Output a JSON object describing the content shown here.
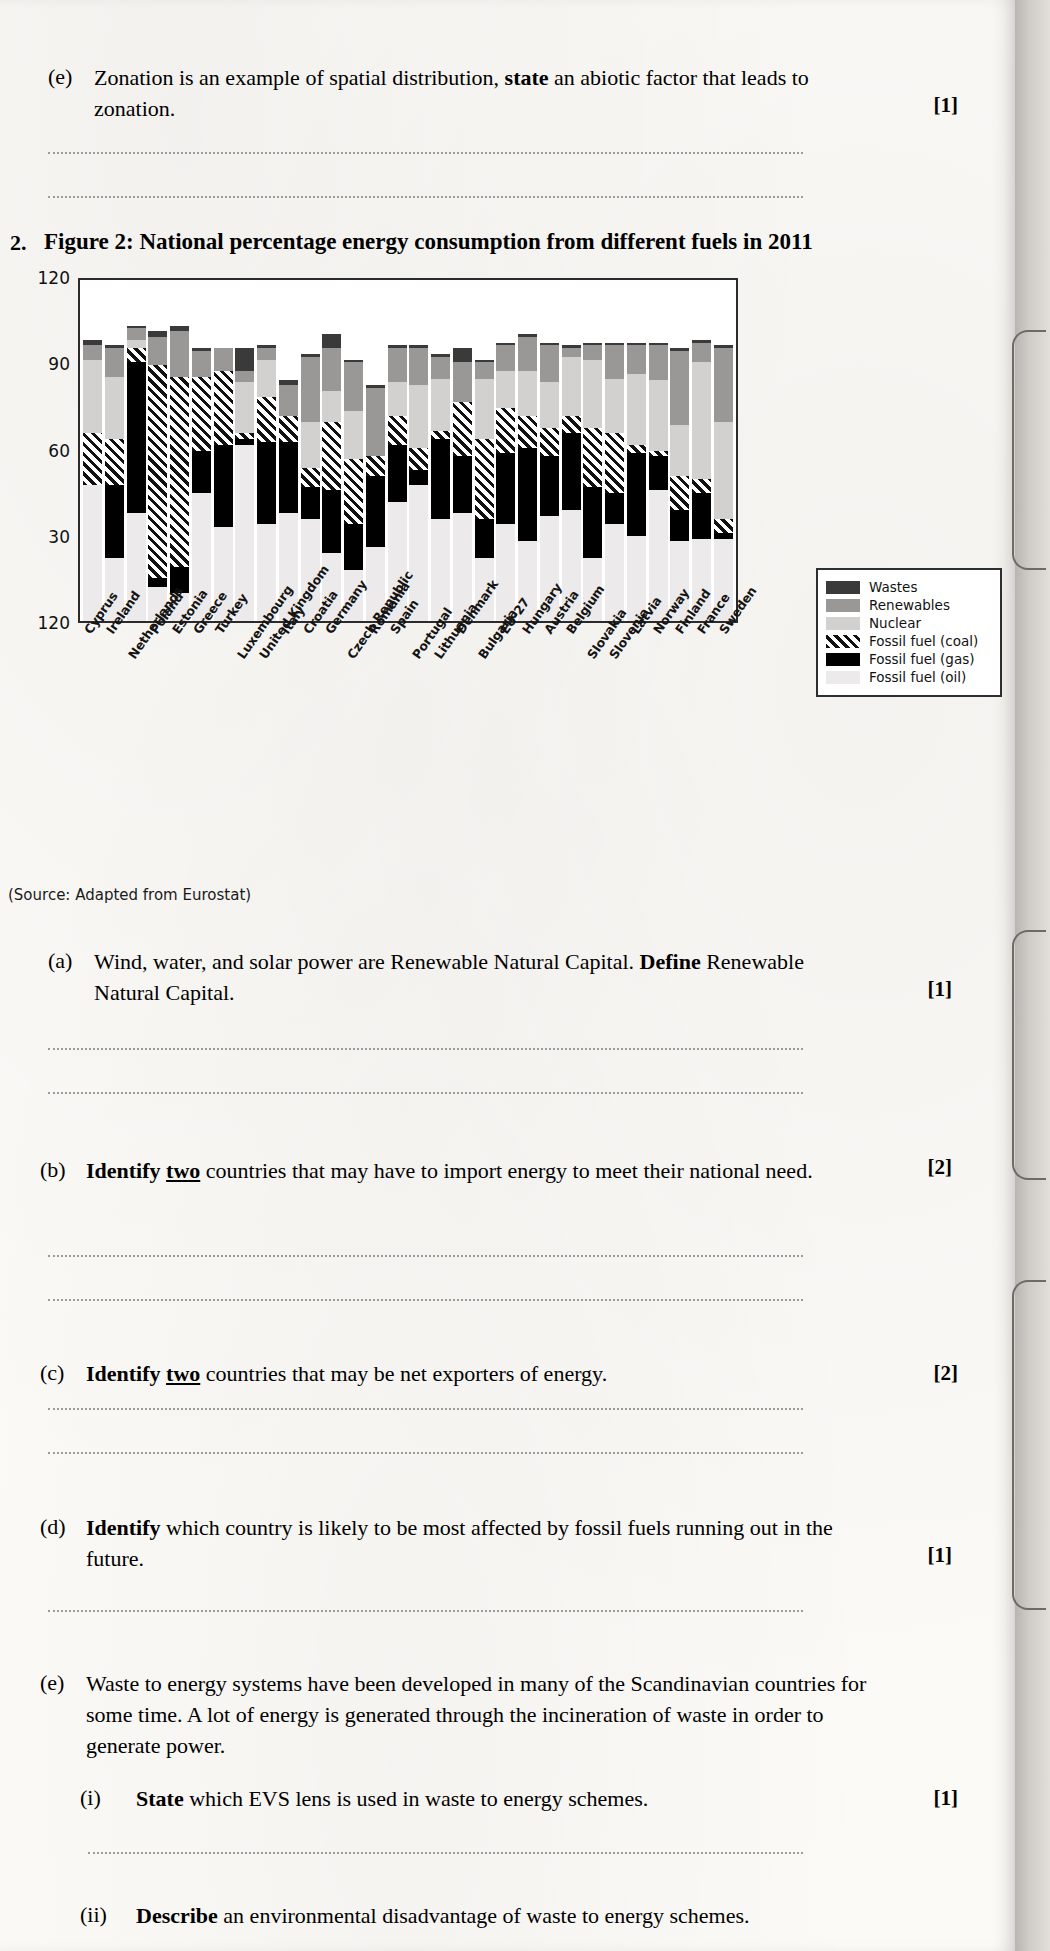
{
  "page": {
    "source_note": "(Source: Adapted from Eurostat)"
  },
  "q1e": {
    "label": "(e)",
    "text_before": "Zonation is an example of spatial distribution, ",
    "bold": "state",
    "text_after": " an abiotic factor that leads to zonation.",
    "marks": "[1]"
  },
  "question2": {
    "number": "2.",
    "figure_title": "Figure 2: National percentage energy consumption from different fuels in 2011",
    "parts": [
      {
        "label": "(a)",
        "text_before": "Wind, water, and solar power are Renewable Natural Capital. ",
        "bold": "Define",
        "text_after": " Renewable Natural Capital.",
        "marks": "[1]",
        "lines": 2
      },
      {
        "label": "(b)",
        "bold": "Identify",
        "underlined": "two",
        "text_after": " countries that may have to import energy to meet their national need.",
        "marks": "[2]",
        "lines": 2
      },
      {
        "label": "(c)",
        "bold": "Identify",
        "underlined": "two",
        "text_after": " countries that may be net exporters of energy.",
        "marks": "[2]",
        "lines": 2
      },
      {
        "label": "(d)",
        "bold": "Identify",
        "text_after": " which country is likely to be most affected by fossil fuels running out in the future.",
        "marks": "[1]",
        "lines": 1
      },
      {
        "label": "(e)",
        "text": "Waste to energy systems have been developed in many of the Scandinavian countries for some time. A lot of energy is generated through the incineration of waste in order to generate power.",
        "subparts": [
          {
            "label": "(i)",
            "bold": "State",
            "text_after": " which EVS lens is used in waste to energy schemes.",
            "marks": "[1]",
            "lines": 1
          },
          {
            "label": "(ii)",
            "bold": "Describe",
            "text_after": " an environmental disadvantage of waste to energy schemes.",
            "marks": "",
            "lines": 0
          }
        ]
      }
    ]
  },
  "chart_data": {
    "type": "bar",
    "subtype": "stacked",
    "title": "Figure 2: National percentage energy consumption from different fuels in 2011",
    "xlabel": "",
    "ylabel": "Percentage of national consumption",
    "ylim": [
      0,
      120
    ],
    "yticks": [
      0,
      30,
      60,
      90,
      120
    ],
    "ytick_labels": [
      "120",
      "30",
      "60",
      "90",
      "120"
    ],
    "grid": false,
    "legend_position": "upper right",
    "legend": [
      "Wastes",
      "Renewables",
      "Nuclear",
      "Fossil fuel (coal)",
      "Fossil fuel (gas)",
      "Fossil fuel (oil)"
    ],
    "colors": {
      "Wastes": "#3a3a3a",
      "Renewables": "#9a9896",
      "Nuclear": "#d3d1cf",
      "Fossil fuel (coal)": "#111111",
      "Fossil fuel (gas)": "#000000",
      "Fossil fuel (oil)": "#eceaea"
    },
    "categories": [
      "Cyprus",
      "Ireland",
      "Netherlands",
      "Poland",
      "Estonia",
      "Greece",
      "Turkey",
      "Luxembourg",
      "United Kingdom",
      "Italy",
      "Croatia",
      "Germany",
      "Czech Republic",
      "Romania",
      "Spain",
      "Portugal",
      "Lithuania",
      "Denmark",
      "Bulgaria",
      "EU-27",
      "Hungary",
      "Austria",
      "Belgium",
      "Slovakia",
      "Slovenia",
      "Latvia",
      "Norway",
      "Finland",
      "France",
      "Sweden"
    ],
    "series": [
      {
        "name": "Fossil fuel (oil)",
        "values": [
          48,
          22,
          38,
          12,
          10,
          45,
          33,
          62,
          34,
          38,
          36,
          24,
          18,
          26,
          42,
          48,
          36,
          38,
          22,
          34,
          28,
          37,
          39,
          22,
          34,
          30,
          46,
          28,
          29,
          29
        ]
      },
      {
        "name": "Fossil fuel (gas)",
        "values": [
          0,
          26,
          53,
          3,
          9,
          15,
          29,
          2,
          29,
          25,
          11,
          22,
          16,
          25,
          20,
          5,
          28,
          20,
          14,
          25,
          33,
          21,
          27,
          25,
          11,
          29,
          12,
          11,
          16,
          2
        ]
      },
      {
        "name": "Fossil fuel (coal)",
        "values": [
          18,
          16,
          5,
          75,
          67,
          26,
          26,
          2,
          16,
          9,
          7,
          24,
          23,
          7,
          10,
          8,
          3,
          19,
          28,
          16,
          11,
          10,
          6,
          21,
          21,
          3,
          2,
          12,
          5,
          5
        ]
      },
      {
        "name": "Nuclear",
        "values": [
          26,
          22,
          3,
          0,
          0,
          0,
          0,
          18,
          13,
          0,
          16,
          11,
          17,
          0,
          12,
          22,
          18,
          0,
          21,
          13,
          16,
          16,
          21,
          24,
          19,
          25,
          25,
          18,
          41,
          34
        ]
      },
      {
        "name": "Renewables",
        "values": [
          5,
          10,
          4,
          10,
          16,
          9,
          8,
          4,
          4,
          11,
          23,
          15,
          17,
          24,
          12,
          13,
          8,
          14,
          6,
          9,
          12,
          13,
          3,
          5,
          12,
          10,
          12,
          26,
          7,
          26
        ]
      },
      {
        "name": "Wastes",
        "values": [
          2,
          1,
          1,
          2,
          2,
          1,
          0,
          8,
          1,
          2,
          1,
          5,
          1,
          1,
          1,
          1,
          1,
          5,
          1,
          1,
          1,
          1,
          1,
          1,
          1,
          1,
          1,
          1,
          1,
          1
        ]
      }
    ]
  }
}
